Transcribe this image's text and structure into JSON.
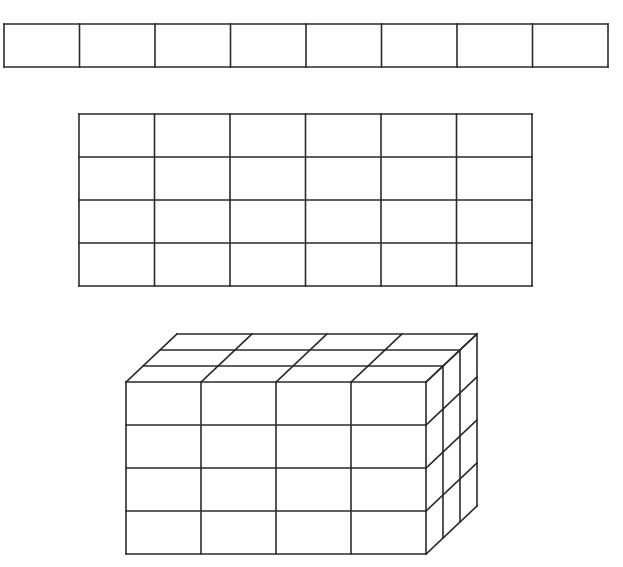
{
  "figure": {
    "colors": {
      "line": "#2a2a2a",
      "background": "#ffffff"
    },
    "strip": {
      "columns": 8,
      "rows": 1,
      "x": 4,
      "y": 24,
      "width": 604,
      "height": 43
    },
    "grid": {
      "columns": 6,
      "rows": 4,
      "x": 79,
      "y": 114,
      "width": 453,
      "height": 172
    },
    "prism": {
      "columns": 4,
      "rows": 4,
      "depth": 3,
      "front": {
        "x": 126,
        "y": 382,
        "width": 300,
        "height": 172
      },
      "depth_offset": {
        "dx": 17,
        "dy": -16
      }
    }
  }
}
